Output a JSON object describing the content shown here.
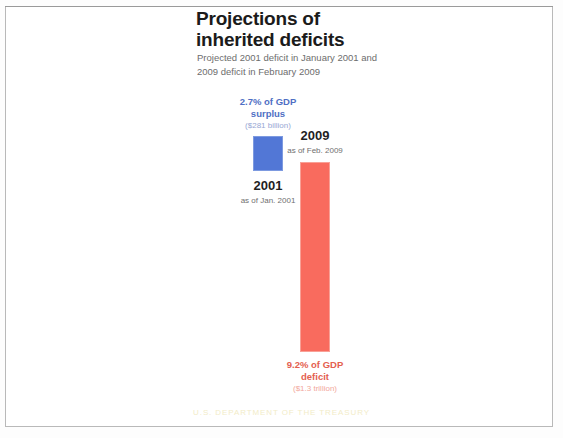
{
  "slide": {
    "title_line1": "Projections of",
    "title_line2": "inherited deficits",
    "subtitle_line1": "Projected 2001 deficit in January 2001 and",
    "subtitle_line2": "2009 deficit in February 2009",
    "footer": "U.S. DEPARTMENT OF THE TREASURY"
  },
  "columns": {
    "surplus_2001": {
      "value_line1": "2.7% of GDP",
      "value_line2": "surplus",
      "amount": "($281 billion)",
      "year": "2001",
      "as_of": "as of Jan. 2001",
      "color": "#5277d6"
    },
    "deficit_2009": {
      "year": "2009",
      "as_of": "as of Feb. 2009",
      "value_line1": "9.2% of GDP",
      "value_line2": "deficit",
      "amount": "($1.3 trillion)",
      "color": "#f96b5e"
    }
  },
  "chart_data": {
    "type": "bar",
    "title": "Projections of inherited deficits",
    "subtitle": "Projected 2001 deficit in January 2001 and 2009 deficit in February 2009",
    "xlabel": "",
    "ylabel": "Percent of GDP",
    "categories": [
      "2001",
      "2009"
    ],
    "values": [
      2.7,
      -9.2
    ],
    "value_labels": [
      "2.7% of GDP surplus",
      "9.2% of GDP deficit"
    ],
    "amount_labels": [
      "($281 billion)",
      "($1.3 trillion)"
    ],
    "as_of_labels": [
      "as of Jan. 2001",
      "as of Feb. 2009"
    ],
    "colors": [
      "#5277d6",
      "#f96b5e"
    ],
    "grid": false,
    "legend": "none"
  }
}
